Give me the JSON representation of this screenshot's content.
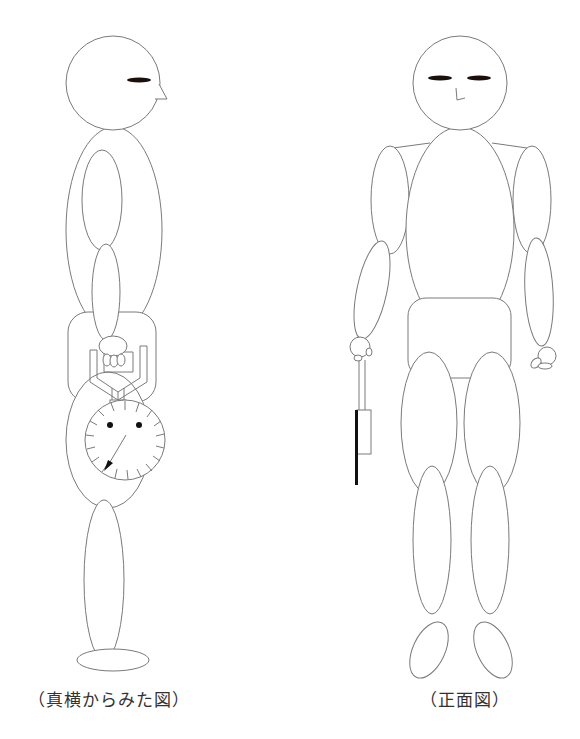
{
  "figures": {
    "side_view": {
      "caption": "（真横からみた図）",
      "description": "Mannequin figure seen from the side, holding a dial-type grip dynamometer in front of the hips"
    },
    "front_view": {
      "caption": "（正面図）",
      "description": "Mannequin figure seen from the front, holding a dynamometer in the right hand hanging down"
    }
  },
  "colors": {
    "outline": "#7a7a7a",
    "eye": "#1a0f0a",
    "background": "#ffffff",
    "caption_text": "#333333"
  }
}
